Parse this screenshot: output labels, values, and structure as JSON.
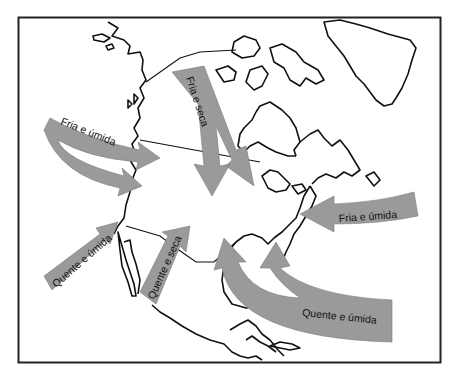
{
  "map": {
    "title": "",
    "region": "North America",
    "colors": {
      "arrow_fill": "#9a9a9a",
      "outline": "#111111",
      "background": "#ffffff"
    },
    "air_masses": [
      {
        "id": "pacific-north",
        "label": "Fria e úmida",
        "direction": "west-to-east",
        "origin": "North Pacific"
      },
      {
        "id": "arctic",
        "label": "Fria e seca",
        "direction": "north-to-south",
        "origin": "Arctic Canada"
      },
      {
        "id": "atlantic-north",
        "label": "Fria e úmida",
        "direction": "east-to-west",
        "origin": "North Atlantic"
      },
      {
        "id": "pacific-south",
        "label": "Quente e úmida",
        "direction": "southwest-to-northeast",
        "origin": "South Pacific"
      },
      {
        "id": "mexico",
        "label": "Quente e seca",
        "direction": "south-to-north",
        "origin": "Northern Mexico"
      },
      {
        "id": "gulf",
        "label": "Quente e úmida",
        "direction": "southeast-to-northwest",
        "origin": "Gulf of Mexico / Caribbean"
      }
    ]
  }
}
